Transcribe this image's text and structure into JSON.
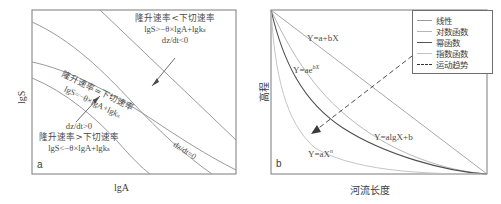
{
  "figure": {
    "panels": [
      {
        "id": "a",
        "letter": "a",
        "x_axis_label": "lgA",
        "y_axis_label": "lgS",
        "annotations": {
          "top_region_line1": "隆升速率<下切速率",
          "top_region_line2": "lgS>−θ×lgA+lgkₛ",
          "top_region_line3": "dz/dt<0",
          "mid_line1": "隆升速率=下切速率",
          "mid_line2": "lgS=−θ×lgA+lgkₛ",
          "bottom_region_line1": "dz/dt>0",
          "bottom_region_line2": "隆升速率>下切速率",
          "bottom_region_line3": "lgS<−θ×lgA+lgkₛ",
          "dzdt_zero": "dz/dt=0"
        }
      },
      {
        "id": "b",
        "letter": "b",
        "x_axis_label": "河流长度",
        "y_axis_label": "高程",
        "curve_labels": {
          "linear": "Y=a+bX",
          "exponential": "Y=ae",
          "exponential_exp": "bX",
          "logarithmic": "Y=algX+b",
          "power": "Y=aX",
          "power_exp": "n"
        },
        "legend": {
          "items": [
            {
              "label": "线性",
              "style": "solid",
              "color": "#9a9a9a"
            },
            {
              "label": "对数函数",
              "style": "solid",
              "color": "#b5b5b5"
            },
            {
              "label": "幂函数",
              "style": "solid",
              "color": "#555555"
            },
            {
              "label": "指数函数",
              "style": "solid",
              "color": "#c2c2c2"
            },
            {
              "label": "运动趋势",
              "style": "dashed",
              "color": "#333333"
            }
          ]
        }
      }
    ],
    "colors": {
      "frame": "#7a7a7a",
      "curve_gray": "#8c8c8c",
      "text": "#4a4a4a",
      "arrow": "#3a3a3a"
    }
  },
  "chart_data": [
    {
      "type": "line",
      "panel": "a",
      "title": "",
      "xlabel": "lgA",
      "ylabel": "lgS",
      "grid": false,
      "legend_position": "none",
      "series": [
        {
          "name": "lgS = -θ×lgA + lgk_s (upper)",
          "note": "upper boundary curve, concave decreasing",
          "x": [
            0,
            0.2,
            0.4,
            0.6,
            0.8,
            1.0
          ],
          "y": [
            1.0,
            0.72,
            0.5,
            0.33,
            0.2,
            0.1
          ]
        },
        {
          "name": "lgS = -θ×lgA + lgk_s (middle)",
          "note": "steady-state line where uplift equals incision",
          "x": [
            0,
            0.2,
            0.4,
            0.6,
            0.8,
            1.0
          ],
          "y": [
            0.75,
            0.5,
            0.3,
            0.16,
            0.06,
            0.0
          ]
        },
        {
          "name": "lower boundary",
          "note": "lower curve bounding the uplift>incision field",
          "x": [
            0,
            0.2,
            0.4,
            0.6,
            0.8,
            0.95
          ],
          "y": [
            0.55,
            0.42,
            0.3,
            0.2,
            0.1,
            0.0
          ]
        },
        {
          "name": "straight diagonal",
          "note": "straight line crossing the curved family",
          "x": [
            0.33,
            1.0
          ],
          "y": [
            1.0,
            0.08
          ]
        }
      ],
      "annotations": [
        "隆升速率<下切速率",
        "lgS>−θ×lgA+lgkₛ",
        "dz/dt<0",
        "隆升速率=下切速率",
        "lgS=−θ×lgA+lgkₛ",
        "dz/dt>0",
        "隆升速率>下切速率",
        "lgS<−θ×lgA+lgkₛ",
        "dz/dt=0"
      ]
    },
    {
      "type": "line",
      "panel": "b",
      "title": "",
      "xlabel": "河流长度",
      "ylabel": "高程",
      "grid": false,
      "legend_position": "top-right",
      "xlim": [
        0,
        1
      ],
      "ylim": [
        0,
        1
      ],
      "series": [
        {
          "name": "线性",
          "equation": "Y=a+bX",
          "x": [
            0,
            0.25,
            0.5,
            0.75,
            1.0
          ],
          "y": [
            1.0,
            0.75,
            0.5,
            0.25,
            0.0
          ]
        },
        {
          "name": "对数函数",
          "equation": "Y=algX+b",
          "x": [
            0,
            0.1,
            0.25,
            0.5,
            0.75,
            1.0
          ],
          "y": [
            1.0,
            0.66,
            0.45,
            0.26,
            0.12,
            0.0
          ]
        },
        {
          "name": "幂函数",
          "equation": "Y=aX^n",
          "x": [
            0,
            0.08,
            0.2,
            0.4,
            0.6,
            0.8,
            1.0
          ],
          "y": [
            1.0,
            0.52,
            0.3,
            0.17,
            0.1,
            0.05,
            0.0
          ]
        },
        {
          "name": "指数函数",
          "equation": "Y=ae^bX",
          "x": [
            0,
            0.05,
            0.12,
            0.25,
            0.45,
            0.7,
            1.0
          ],
          "y": [
            1.0,
            0.42,
            0.2,
            0.09,
            0.04,
            0.015,
            0.0
          ]
        },
        {
          "name": "运动趋势",
          "equation": "",
          "note": "dashed double-headed arrow indicating evolution direction",
          "x": [
            0.72,
            0.14
          ],
          "y": [
            0.78,
            0.26
          ]
        }
      ]
    }
  ]
}
